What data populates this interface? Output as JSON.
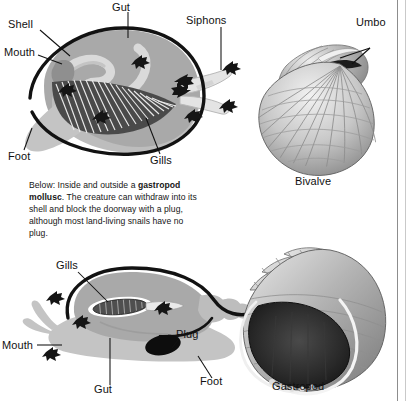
{
  "page": {
    "width": 407,
    "height": 401,
    "background": "#ffffff",
    "rule_color": "#8d8d8d"
  },
  "figures": [
    {
      "id": "bivalve-cross-section",
      "type": "anatomical-diagram",
      "subject": "bivalve mollusc internal anatomy",
      "labels": [
        "Shell",
        "Mouth",
        "Gut",
        "Siphons",
        "Gills",
        "Foot"
      ]
    },
    {
      "id": "bivalve-shell-photo",
      "type": "photograph",
      "subject": "bivalve shell exterior",
      "labels": [
        "Umbo"
      ],
      "caption": "Bivalve"
    },
    {
      "id": "gastropod-cross-section",
      "type": "anatomical-diagram",
      "subject": "gastropod mollusc internal anatomy",
      "labels": [
        "Gills",
        "Plug",
        "Mouth",
        "Gut",
        "Foot"
      ]
    },
    {
      "id": "gastropod-shell-photo",
      "type": "photograph",
      "subject": "gastropod shell with aperture",
      "caption": "Gastropod"
    }
  ],
  "top_diagram": {
    "label_shell": "Shell",
    "label_mouth": "Mouth",
    "label_gut": "Gut",
    "label_siphons": "Siphons",
    "label_gills": "Gills",
    "label_foot": "Foot"
  },
  "top_right": {
    "label_umbo": "Umbo",
    "caption": "Bivalve"
  },
  "caption_block": {
    "lead": "Below: Inside and outside a ",
    "bold_term": "gastropod mollusc",
    "rest": ". The creature can withdraw into its shell and block the doorway with a plug, although most land-living snails have no plug.",
    "full_text": "Below: Inside and outside a gastropod mollusc. The creature can withdraw into its shell and block the doorway with a plug, although most land-living snails have no plug.",
    "lines": [
      "Below: Inside and outside a",
      "gastropod mollusc. The creature",
      "can withdraw into its shell and",
      "block the doorway with a plug,",
      "although most land-living snails",
      "have no plug."
    ]
  },
  "bottom_diagram": {
    "label_gills": "Gills",
    "label_plug": "Plug",
    "label_mouth": "Mouth",
    "label_gut": "Gut",
    "label_foot": "Foot"
  },
  "bottom_right": {
    "caption": "Gastropod"
  },
  "colors": {
    "ink": "#111111",
    "body_gray": "#a9a9a9",
    "mantle_gray": "#bdbdbd",
    "foot_gray": "#c4c4c4",
    "gut_gray": "#d8d8d8",
    "shell_outline": "#121212",
    "page_white": "#ffffff"
  }
}
